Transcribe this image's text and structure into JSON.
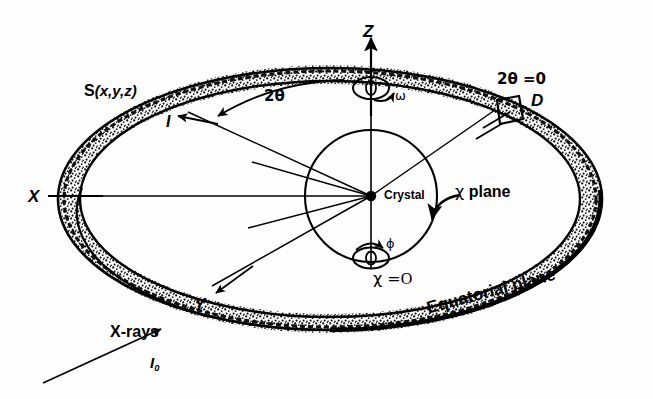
{
  "figure": {
    "background_color": "#fefefe",
    "ink_color": "#000000"
  },
  "labels": {
    "scattering_vector": {
      "s_symbol": "S",
      "coords": "(x,y,z)"
    },
    "diffracted_beam": "I",
    "two_theta": "2θ",
    "two_theta_zero": "2θ =0",
    "omega": "ω",
    "phi": "ϕ",
    "chi_zero_symbol": "χ =",
    "chi_zero_value": "O",
    "chi_plane_symbol": "χ",
    "chi_plane_word": "plane",
    "detector": "D",
    "crystal": "Crystal",
    "z_axis": "Z",
    "x_axis": "X",
    "y_axis": "Y",
    "xrays": "X-rays",
    "incident_beam_symbol": "I",
    "incident_beam_sub": "0",
    "equatorial_plane": "Equatorial  plane"
  },
  "geometry": {
    "ring_center_x": 330,
    "ring_center_y": 199,
    "ring_outer_rx": 272,
    "ring_outer_ry": 131,
    "ring_inner_rx": 250,
    "ring_inner_ry": 118,
    "chi_circle_cx": 371,
    "chi_circle_cy": 196,
    "chi_circle_r": 66,
    "crystal_dot_x": 371,
    "crystal_dot_y": 196,
    "z_axis_top_y": 31,
    "two_theta_value_deg": 0
  }
}
